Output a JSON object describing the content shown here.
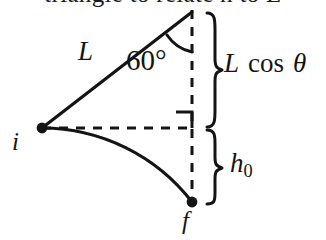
{
  "figure": {
    "caption_above_cropped": "triangle to relate h  to L",
    "background_color": "#ffffff",
    "stroke_color": "#141414"
  },
  "labels": {
    "rod_length": "L",
    "angle": "60°",
    "initial_point": "i",
    "final_point": "f",
    "vertical_projection": {
      "symbol": "L",
      "function": "cos",
      "variable": "θ",
      "full": "L cos θ"
    },
    "height_drop": {
      "symbol": "h",
      "subscript": "0",
      "full": "h0"
    }
  },
  "geometry": {
    "pivot": {
      "x": 192,
      "y": 12,
      "name": "support-point"
    },
    "initial_bob": {
      "x": 42,
      "y": 128,
      "name": "point-i"
    },
    "final_bob": {
      "x": 192,
      "y": 202,
      "name": "point-f"
    },
    "horizontal_dashed_from": {
      "x": 42,
      "y": 128
    },
    "horizontal_dashed_to": {
      "x": 192,
      "y": 128
    },
    "right_angle_marker": {
      "x": 192,
      "y": 128,
      "size": 16
    },
    "angle_arc_degrees": 60,
    "brace_upper_span": {
      "top": 12,
      "bottom": 128
    },
    "brace_lower_span": {
      "top": 128,
      "bottom": 203
    }
  },
  "icons": {
    "dot_i": "filled-dot-icon",
    "dot_f": "filled-dot-icon",
    "brace_upper": "curly-brace-icon",
    "brace_lower": "curly-brace-icon",
    "angle_arc": "angle-arc-icon",
    "right_angle": "right-angle-marker-icon"
  }
}
